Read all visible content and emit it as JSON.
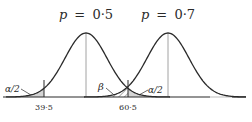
{
  "diagram": {
    "distributions": [
      {
        "label": "p = 0·5",
        "p_symbol": "p",
        "equals": "=",
        "value": "0·5"
      },
      {
        "label": "p = 0·7",
        "p_symbol": "p",
        "equals": "=",
        "value": "0·7"
      }
    ],
    "critical_values": [
      "39·5",
      "60·5"
    ],
    "regions": {
      "left_tail": "α/2",
      "beta": "β",
      "right_tail": "α/2"
    },
    "colors": {
      "curve": "#2a2a2a",
      "axis": "#2a2a2a",
      "shade": "#d4d4d4",
      "hatch": "#2a2a2a",
      "center_line": "#8a8a8a",
      "axis_faint": "#c8c8c8"
    }
  }
}
